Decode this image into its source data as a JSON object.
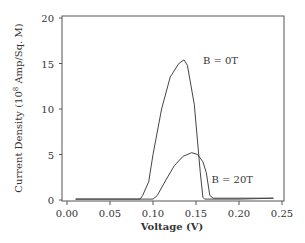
{
  "chart_data": {
    "type": "line",
    "title": "",
    "xlabel": "Voltage (V)",
    "ylabel": "Current Density (10^8 Amp/Sq. M)",
    "ylabel_parts": {
      "pre": "Current Density (10",
      "sup": "8",
      "post": " Amp/Sq. M)"
    },
    "xlim": [
      0.0,
      0.25
    ],
    "ylim": [
      0,
      20
    ],
    "xticks": [
      0.0,
      0.05,
      0.1,
      0.15,
      0.2,
      0.25
    ],
    "xtick_labels": [
      "0.00",
      "0.05",
      "0.10",
      "0.15",
      "0.20",
      "0.25"
    ],
    "yticks": [
      0,
      5,
      10,
      15,
      20
    ],
    "ytick_labels": [
      "0",
      "5",
      "10",
      "15",
      "20"
    ],
    "grid": false,
    "legend": "none (inline annotations)",
    "series": [
      {
        "name": "B = 0T",
        "x": [
          0.01,
          0.085,
          0.088,
          0.095,
          0.1,
          0.11,
          0.12,
          0.13,
          0.136,
          0.14,
          0.148,
          0.155,
          0.158,
          0.16,
          0.17,
          0.2,
          0.24
        ],
        "y": [
          0.1,
          0.1,
          0.5,
          2.0,
          5.0,
          10.0,
          13.5,
          15.0,
          15.4,
          14.8,
          10.5,
          3.0,
          0.3,
          0.1,
          0.1,
          0.1,
          0.2
        ]
      },
      {
        "name": "B = 20T",
        "x": [
          0.01,
          0.1,
          0.105,
          0.115,
          0.125,
          0.135,
          0.145,
          0.152,
          0.158,
          0.162,
          0.166,
          0.17,
          0.2,
          0.24
        ],
        "y": [
          0.1,
          0.1,
          0.5,
          2.2,
          3.8,
          4.8,
          5.2,
          5.0,
          4.2,
          3.0,
          0.5,
          0.2,
          0.2,
          0.2
        ]
      }
    ],
    "annotations": [
      {
        "text": "B = 0T",
        "x": 0.158,
        "y": 15.4
      },
      {
        "text": "B = 20T",
        "x": 0.168,
        "y": 2.3
      }
    ]
  }
}
